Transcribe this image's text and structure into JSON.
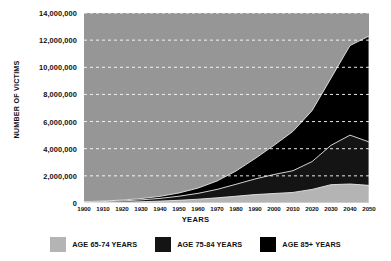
{
  "chart_data": {
    "type": "area",
    "stacked": true,
    "title": "",
    "xlabel": "YEARS",
    "ylabel": "NUMBER OF VICTIMS",
    "x": [
      1900,
      1910,
      1920,
      1930,
      1940,
      1950,
      1960,
      1970,
      1980,
      1990,
      2000,
      2010,
      2020,
      2030,
      2040,
      2050
    ],
    "categories": [
      "1900",
      "1910",
      "1920",
      "1930",
      "1940",
      "1950",
      "1960",
      "1970",
      "1980",
      "1990",
      "2000",
      "2010",
      "2020",
      "2030",
      "2040",
      "2050"
    ],
    "xtick_labels": [
      "1900",
      "1910",
      "1920",
      "1930",
      "1940",
      "1950",
      "1960",
      "1970",
      "1980",
      "1990",
      "2000",
      "2010",
      "2020",
      "2030",
      "2040",
      "2050"
    ],
    "ytick_labels": [
      "0",
      "2,000,000",
      "4,000,000",
      "6,000,000",
      "8,000,000",
      "10,000,000",
      "12,000,000",
      "14,000,000"
    ],
    "ytick_values": [
      0,
      2000000,
      4000000,
      6000000,
      8000000,
      10000000,
      12000000,
      14000000
    ],
    "ylim": [
      0,
      14000000
    ],
    "xlim": [
      1900,
      2050
    ],
    "grid": "horizontal-dashed-white",
    "legend_position": "bottom-center",
    "plot_background": "#969696",
    "series": [
      {
        "name": "AGE 65-74 YEARS",
        "color": "#b4b4b4",
        "values": [
          30000,
          45000,
          65000,
          95000,
          140000,
          200000,
          280000,
          380000,
          500000,
          620000,
          700000,
          780000,
          1000000,
          1350000,
          1400000,
          1300000
        ]
      },
      {
        "name": "AGE 75-84 YEARS",
        "color": "#141414",
        "values": [
          40000,
          60000,
          90000,
          135000,
          200000,
          300000,
          430000,
          620000,
          880000,
          1150000,
          1400000,
          1600000,
          2050000,
          2900000,
          3600000,
          3200000
        ]
      },
      {
        "name": "AGE 85+ YEARS",
        "color": "#000000",
        "values": [
          25000,
          40000,
          60000,
          95000,
          150000,
          240000,
          390000,
          620000,
          980000,
          1500000,
          2150000,
          2900000,
          3750000,
          4950000,
          6600000,
          7800000
        ]
      }
    ],
    "totals": [
      95000,
      145000,
      215000,
      325000,
      490000,
      740000,
      1100000,
      1620000,
      2360000,
      3270000,
      4250000,
      5280000,
      6800000,
      9200000,
      11600000,
      12300000
    ]
  },
  "legend": {
    "items": [
      {
        "label": "AGE 65-74 YEARS",
        "color": "#b4b4b4"
      },
      {
        "label": "AGE 75-84 YEARS",
        "color": "#141414"
      },
      {
        "label": "AGE 85+ YEARS",
        "color": "#000000"
      }
    ]
  }
}
